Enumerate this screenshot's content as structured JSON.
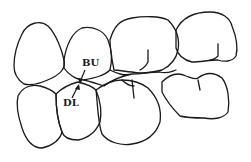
{
  "diagram": {
    "type": "dental-occlusion-outline",
    "labels": [
      {
        "id": "bu",
        "text": "BU",
        "x": 82,
        "y": 66
      },
      {
        "id": "dl",
        "text": "DL",
        "x": 63,
        "y": 106
      }
    ],
    "colors": {
      "stroke": "#1a1a1a",
      "background": "#ffffff"
    }
  }
}
